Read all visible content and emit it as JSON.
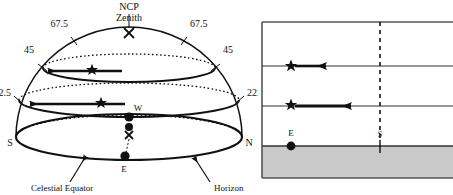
{
  "figure": {
    "background_color": "#ffffff",
    "ink_color": "#111111",
    "shade_color": "#c9c9c9"
  },
  "left_panel": {
    "name": "celestial-sphere-dome",
    "labels": {
      "ncp_zenith": "NCP\nZenith",
      "ncp": "NCP",
      "zenith": "Zenith",
      "alt_675_left": "67.5",
      "alt_675_right": "67.5",
      "alt_45_left": "45",
      "alt_45_right": "45",
      "alt_225_left": "22.5",
      "alt_225_right": "22.5",
      "south": "S",
      "north": "N",
      "west": "W",
      "east": "E",
      "celestial_equator": "Celestial Equator",
      "horizon": "Horizon"
    },
    "markers": {
      "zenith_marker": "x-cross",
      "observer_marker": "x-cross",
      "star_glyph": "five-point-star",
      "dot_glyph": "filled-circle"
    },
    "star_count": 2,
    "dot_count": 3,
    "arrow_direction": "westward"
  },
  "right_panel": {
    "name": "horizon-box-panel",
    "labels": {
      "east": "E",
      "south": "S"
    },
    "rows": [
      {
        "id": "row-1",
        "has_star": false,
        "has_arrow": false
      },
      {
        "id": "row-2",
        "has_star": true,
        "has_arrow": true,
        "arrow_length_short": true
      },
      {
        "id": "row-3",
        "has_star": true,
        "has_arrow": true,
        "arrow_length_short": false
      },
      {
        "id": "row-4",
        "has_star": false,
        "has_arrow": false,
        "has_dot": true
      }
    ],
    "meridian_line_style": "dashed",
    "ground_shaded": true,
    "border": true
  }
}
